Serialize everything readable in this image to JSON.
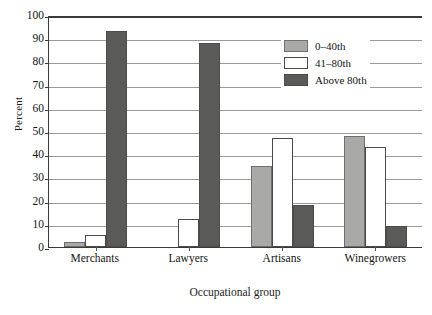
{
  "chart_data": {
    "type": "bar",
    "title": "",
    "xlabel": "Occupational group",
    "ylabel": "Percent",
    "categories": [
      "Merchants",
      "Lawyers",
      "Artisans",
      "Winegrowers"
    ],
    "series": [
      {
        "name": "0–40th",
        "values": [
          2,
          0,
          35,
          48
        ],
        "color": "#a9a9a7"
      },
      {
        "name": "41–80th",
        "values": [
          5,
          12,
          47,
          43
        ],
        "color": "#ffffff"
      },
      {
        "name": "Above 80th",
        "values": [
          93,
          88,
          18,
          9
        ],
        "color": "#5a5a58"
      }
    ],
    "ylim": [
      0,
      100
    ],
    "yticks": [
      0,
      10,
      20,
      30,
      40,
      50,
      60,
      70,
      80,
      90,
      100
    ],
    "ytick_labels": [
      "0",
      "10",
      "20",
      "30",
      "40",
      "50",
      "60",
      "70",
      "80",
      "90",
      "100"
    ],
    "grid": true,
    "legend_position": "top-right"
  },
  "legend": {
    "items": [
      {
        "label": "0–40th"
      },
      {
        "label": "41–80th"
      },
      {
        "label": "Above 80th"
      }
    ]
  }
}
